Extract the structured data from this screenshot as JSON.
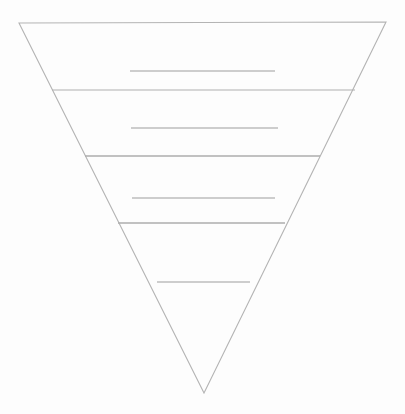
{
  "document": {
    "title": "Inverted Pyramid Template",
    "kind": "blank-worksheet-diagram",
    "background_color": "#fdfdfd",
    "canvas": {
      "width": 405,
      "height": 414
    }
  },
  "diagram": {
    "name": "inverted-pyramid",
    "shape": "inverted-triangle",
    "title_text": "",
    "stroke_color": "#b4b4b4",
    "stroke_color_dark": "#a6a6a6",
    "stroke_width": 1.1,
    "fill_color": "none",
    "outline": {
      "top_left": {
        "x": 19,
        "y": 23
      },
      "top_right": {
        "x": 386,
        "y": 22
      },
      "apex": {
        "x": 204,
        "y": 393
      },
      "points": "19,23 386,22 204,393"
    },
    "tier_count": 4,
    "divider_count": 3,
    "dividers": [
      {
        "index": 1,
        "y": 90,
        "x1": 52,
        "x2": 355,
        "color": "#b0b0b0",
        "width": 1.2
      },
      {
        "index": 2,
        "y": 156,
        "x1": 85,
        "x2": 320,
        "color": "#adadad",
        "width": 1.3
      },
      {
        "index": 3,
        "y": 223,
        "x1": 118,
        "x2": 285,
        "color": "#adadad",
        "width": 1.3
      }
    ],
    "tiers": [
      {
        "index": 1,
        "label": "",
        "top_y": 23,
        "bottom_y": 90,
        "writing_line": {
          "y": 71,
          "x1": 130,
          "x2": 275,
          "color": "#9e9e9e",
          "width": 1.1
        }
      },
      {
        "index": 2,
        "label": "",
        "top_y": 90,
        "bottom_y": 156,
        "writing_line": {
          "y": 128,
          "x1": 131,
          "x2": 278,
          "color": "#9e9e9e",
          "width": 1.1
        }
      },
      {
        "index": 3,
        "label": "",
        "top_y": 156,
        "bottom_y": 223,
        "writing_line": {
          "y": 198,
          "x1": 132,
          "x2": 275,
          "color": "#9e9e9e",
          "width": 1.1
        }
      },
      {
        "index": 4,
        "label": "",
        "top_y": 223,
        "bottom_y": 393,
        "writing_line": {
          "y": 282,
          "x1": 157,
          "x2": 250,
          "color": "#9e9e9e",
          "width": 1.1
        }
      }
    ]
  }
}
